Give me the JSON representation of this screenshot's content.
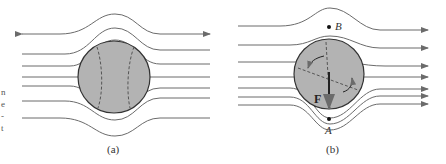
{
  "figure": {
    "panels": [
      {
        "id": "a",
        "caption": "(a)"
      },
      {
        "id": "b",
        "caption": "(b)",
        "labels": {
          "point_top": "B",
          "point_bottom": "A",
          "force": "F"
        }
      }
    ],
    "edge_text": [
      "n",
      "e",
      "-",
      "t"
    ],
    "colors": {
      "line": "#6b6b6b",
      "ball": "#b3b3b3",
      "ball_stroke": "#333333",
      "text": "#333333"
    }
  }
}
